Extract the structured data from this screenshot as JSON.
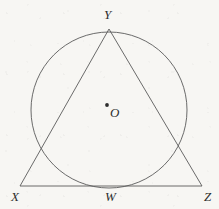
{
  "figure": {
    "background_color": "#f7f6f3",
    "stroke_color": "#5a5a5a",
    "label_color": "#2e2e2e"
  },
  "labels": {
    "apex": "Y",
    "bottom_left": "X",
    "bottom_right": "Z",
    "tangent_point": "W",
    "center": "O"
  },
  "chart_data": {
    "type": "diagram",
    "xlabel": "",
    "ylabel": "",
    "points": [
      {
        "name": "Y",
        "x": 109,
        "y": 29,
        "role": "triangle-apex-on-circle"
      },
      {
        "name": "X",
        "x": 20,
        "y": 186,
        "role": "triangle-vertex"
      },
      {
        "name": "Z",
        "x": 202,
        "y": 186,
        "role": "triangle-vertex"
      },
      {
        "name": "W",
        "x": 109,
        "y": 185,
        "role": "tangent-point-on-base"
      },
      {
        "name": "O",
        "x": 107,
        "y": 105,
        "role": "circle-center"
      }
    ],
    "circle": {
      "cx": 109,
      "cy": 110,
      "r": 78
    },
    "triangle": {
      "vertices": [
        "X",
        "Y",
        "Z"
      ]
    },
    "segments": [
      {
        "from": "X",
        "to": "Y"
      },
      {
        "from": "Y",
        "to": "Z"
      },
      {
        "from": "X",
        "to": "Z"
      }
    ]
  }
}
